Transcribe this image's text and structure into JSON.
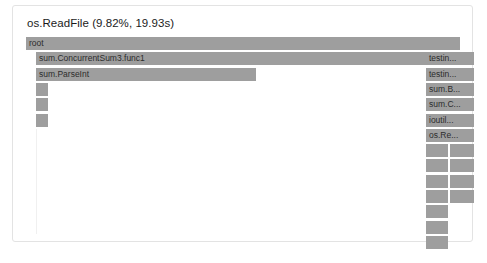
{
  "card": {
    "title": "os.ReadFile (9.82%, 19.93s)"
  },
  "chart_data": {
    "type": "flamegraph",
    "title": "os.ReadFile (9.82%, 19.93s)",
    "focused_function": "os.ReadFile",
    "focused_percent": "9.82%",
    "focused_time": "19.93s",
    "xlabel": "",
    "ylabel": "",
    "grid": false,
    "legend": "none",
    "bar_color": "#9e9e9e",
    "background_color": "#ffffff",
    "row_height": 13,
    "row_pitch": 15.3,
    "total_width": 434,
    "frames": [
      {
        "label": "root",
        "depth": 0,
        "x": 0,
        "w": 434,
        "labeled": true
      },
      {
        "label": "sum.ConcurrentSum3.func1",
        "depth": 1,
        "x": 10,
        "w": 390,
        "labeled": true
      },
      {
        "label": "sum.ParseInt",
        "depth": 2,
        "x": 10,
        "w": 220,
        "labeled": true
      },
      {
        "label": "",
        "depth": 3,
        "x": 10,
        "w": 12,
        "labeled": false
      },
      {
        "label": "",
        "depth": 4,
        "x": 10,
        "w": 12,
        "labeled": false
      },
      {
        "label": "",
        "depth": 5,
        "x": 10,
        "w": 12,
        "labeled": false
      },
      {
        "label": "testin...",
        "depth": 1,
        "x": 400,
        "w": 48,
        "labeled": true
      },
      {
        "label": "testin...",
        "depth": 2,
        "x": 400,
        "w": 48,
        "labeled": true
      },
      {
        "label": "sum.B...",
        "depth": 3,
        "x": 400,
        "w": 48,
        "labeled": true
      },
      {
        "label": "sum.C...",
        "depth": 4,
        "x": 400,
        "w": 48,
        "labeled": true
      },
      {
        "label": "ioutil...",
        "depth": 5,
        "x": 400,
        "w": 48,
        "labeled": true
      },
      {
        "label": "os.Re...",
        "depth": 6,
        "x": 400,
        "w": 48,
        "labeled": true
      },
      {
        "label": "",
        "depth": 7,
        "x": 400,
        "w": 22,
        "labeled": false
      },
      {
        "label": "",
        "depth": 7,
        "x": 424,
        "w": 24,
        "labeled": false
      },
      {
        "label": "",
        "depth": 8,
        "x": 400,
        "w": 22,
        "labeled": false
      },
      {
        "label": "",
        "depth": 8,
        "x": 424,
        "w": 24,
        "labeled": false
      },
      {
        "label": "",
        "depth": 9,
        "x": 400,
        "w": 22,
        "labeled": false
      },
      {
        "label": "",
        "depth": 9,
        "x": 424,
        "w": 24,
        "labeled": false
      },
      {
        "label": "",
        "depth": 10,
        "x": 400,
        "w": 22,
        "labeled": false
      },
      {
        "label": "",
        "depth": 10,
        "x": 424,
        "w": 24,
        "labeled": false
      },
      {
        "label": "",
        "depth": 11,
        "x": 400,
        "w": 22,
        "labeled": false
      },
      {
        "label": "",
        "depth": 12,
        "x": 400,
        "w": 22,
        "labeled": false
      },
      {
        "label": "",
        "depth": 13,
        "x": 400,
        "w": 22,
        "labeled": false
      }
    ],
    "spine": {
      "x": 10,
      "top_depth": 6,
      "width": 1,
      "height": 105
    }
  }
}
